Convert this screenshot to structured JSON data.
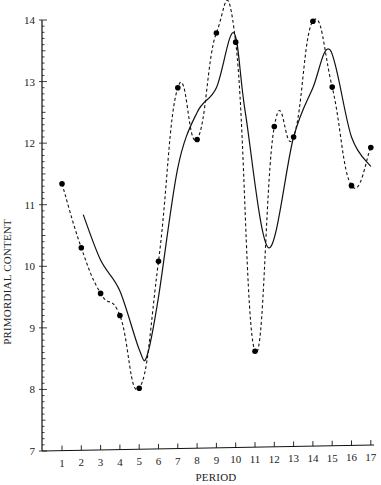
{
  "chart_data": {
    "type": "line",
    "title": "",
    "xlabel": "PERIOD",
    "ylabel": "PRIMORDIAL CONTENT",
    "xlim": [
      0,
      17
    ],
    "ylim": [
      7,
      14
    ],
    "x_ticks": [
      1,
      2,
      3,
      4,
      5,
      6,
      7,
      8,
      9,
      10,
      11,
      12,
      13,
      14,
      15,
      16,
      17
    ],
    "y_ticks": [
      7,
      8,
      9,
      10,
      11,
      12,
      13,
      14
    ],
    "y_minor_step": 0.1,
    "grid": false,
    "legend": null,
    "series": [
      {
        "name": "observed",
        "style": "dashed-with-markers",
        "x": [
          1,
          2,
          3,
          4,
          5,
          6,
          7,
          8,
          9,
          10,
          11,
          12,
          13,
          14,
          15,
          16,
          17
        ],
        "values": [
          11.34,
          10.3,
          9.56,
          9.2,
          8.02,
          10.08,
          12.9,
          12.06,
          13.79,
          13.64,
          8.62,
          12.27,
          12.1,
          13.98,
          12.91,
          11.31,
          11.93
        ]
      },
      {
        "name": "smoothed",
        "style": "solid",
        "x": [
          2.1,
          3,
          4,
          5,
          5.4,
          6,
          7,
          8,
          9,
          9.9,
          10.5,
          11.7,
          13,
          14,
          14.9,
          16,
          17
        ],
        "values": [
          10.84,
          10.1,
          9.6,
          8.65,
          8.54,
          9.5,
          11.6,
          12.5,
          12.9,
          13.79,
          12.5,
          10.3,
          12.1,
          12.9,
          13.51,
          12.1,
          11.62
        ]
      }
    ]
  },
  "axes": {
    "x_title": "PERIOD",
    "y_title": "PRIMORDIAL CONTENT"
  }
}
